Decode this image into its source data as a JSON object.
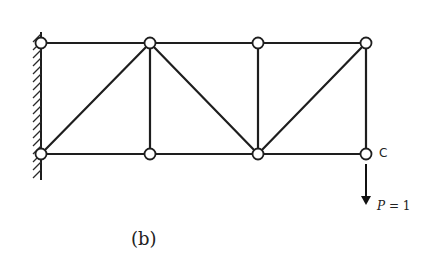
{
  "figure": {
    "caption": "(b)",
    "node_label": "C",
    "load_symbol": "P",
    "load_eq": " = 1"
  },
  "truss": {
    "support": "fixed-wall-left",
    "nodes": [
      {
        "id": "A_top",
        "x": 41,
        "y": 43
      },
      {
        "id": "B_top",
        "x": 150,
        "y": 43
      },
      {
        "id": "D_top",
        "x": 258,
        "y": 43
      },
      {
        "id": "E_top",
        "x": 366,
        "y": 43
      },
      {
        "id": "A_bot",
        "x": 41,
        "y": 154
      },
      {
        "id": "B_bot",
        "x": 150,
        "y": 154
      },
      {
        "id": "D_bot",
        "x": 258,
        "y": 154
      },
      {
        "id": "C",
        "x": 366,
        "y": 154
      }
    ],
    "members": [
      [
        "A_top",
        "E_top"
      ],
      [
        "A_bot",
        "C"
      ],
      [
        "A_bot",
        "B_top"
      ],
      [
        "B_top",
        "B_bot"
      ],
      [
        "B_top",
        "D_bot"
      ],
      [
        "D_top",
        "D_bot"
      ],
      [
        "D_bot",
        "E_top"
      ],
      [
        "E_top",
        "C"
      ]
    ],
    "load": {
      "node": "C",
      "direction": "down",
      "magnitude": 1
    }
  }
}
